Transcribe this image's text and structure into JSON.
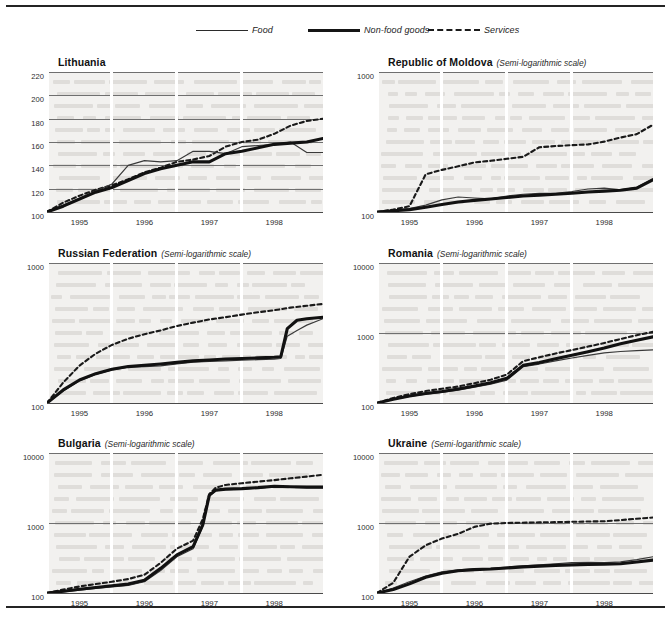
{
  "legend": {
    "items": [
      {
        "key": "food",
        "label": "Food",
        "style": "thin-solid"
      },
      {
        "key": "nonfood",
        "label": "Non-food goods",
        "style": "thick-solid"
      },
      {
        "key": "services",
        "label": "Services",
        "style": "dashed"
      }
    ]
  },
  "scale_note": "(Semi-logarithmic scale)",
  "xticks": [
    "1995",
    "1996",
    "1997",
    "1998"
  ],
  "chart_data": [
    {
      "type": "line",
      "title": "Lithuania",
      "scale": "linear",
      "subtitle": "",
      "xlabel": "",
      "ylabel": "",
      "xlim": [
        1994.5,
        1998.75
      ],
      "ylim": [
        100,
        220
      ],
      "yticks": [
        100,
        120,
        140,
        160,
        180,
        200,
        220
      ],
      "xticks": [
        1995,
        1996,
        1997,
        1998
      ],
      "grid": true,
      "legend_position": "top-center",
      "series": [
        {
          "name": "Food",
          "x": [
            1994.5,
            1994.75,
            1995.0,
            1995.25,
            1995.5,
            1995.75,
            1996.0,
            1996.25,
            1996.5,
            1996.75,
            1997.0,
            1997.25,
            1997.5,
            1997.75,
            1998.0,
            1998.25,
            1998.5,
            1998.75
          ],
          "values": [
            100,
            106,
            112,
            118,
            124,
            140,
            144,
            143,
            144,
            152,
            152,
            150,
            156,
            157,
            158,
            160,
            151,
            151
          ]
        },
        {
          "name": "Non-food goods",
          "x": [
            1994.5,
            1994.75,
            1995.0,
            1995.25,
            1995.5,
            1995.75,
            1996.0,
            1996.25,
            1996.5,
            1996.75,
            1997.0,
            1997.25,
            1997.5,
            1997.75,
            1998.0,
            1998.25,
            1998.5,
            1998.75
          ],
          "values": [
            100,
            105,
            111,
            117,
            121,
            127,
            133,
            137,
            140,
            143,
            143,
            150,
            152,
            155,
            158,
            159,
            160,
            163
          ]
        },
        {
          "name": "Services",
          "x": [
            1994.5,
            1994.75,
            1995.0,
            1995.25,
            1995.5,
            1995.75,
            1996.0,
            1996.25,
            1996.5,
            1996.75,
            1997.0,
            1997.25,
            1997.5,
            1997.75,
            1998.0,
            1998.25,
            1998.5,
            1998.75
          ],
          "values": [
            100,
            108,
            114,
            119,
            123,
            128,
            134,
            138,
            143,
            145,
            148,
            156,
            160,
            162,
            167,
            174,
            178,
            180
          ]
        }
      ]
    },
    {
      "type": "line",
      "title": "Republic of Moldova",
      "scale": "semi-log",
      "subtitle": "(Semi-logarithmic scale)",
      "xlabel": "",
      "ylabel": "",
      "xlim": [
        1994.5,
        1998.75
      ],
      "ylim": [
        100,
        1000
      ],
      "yticks": [
        100,
        1000
      ],
      "xticks": [
        1995,
        1996,
        1997,
        1998
      ],
      "grid": true,
      "legend_position": "top-center",
      "series": [
        {
          "name": "Food",
          "x": [
            1994.5,
            1994.75,
            1995.0,
            1995.25,
            1995.5,
            1995.75,
            1996.0,
            1996.25,
            1996.5,
            1996.75,
            1997.0,
            1997.25,
            1997.5,
            1997.75,
            1998.0,
            1998.25,
            1998.5,
            1998.75
          ],
          "values": [
            100,
            103,
            106,
            112,
            122,
            128,
            126,
            124,
            130,
            134,
            136,
            136,
            140,
            146,
            148,
            144,
            150,
            172
          ]
        },
        {
          "name": "Non-food goods",
          "x": [
            1994.5,
            1994.75,
            1995.0,
            1995.25,
            1995.5,
            1995.75,
            1996.0,
            1996.25,
            1996.5,
            1996.75,
            1997.0,
            1997.25,
            1997.5,
            1997.75,
            1998.0,
            1998.25,
            1998.5,
            1998.75
          ],
          "values": [
            100,
            102,
            104,
            108,
            113,
            118,
            121,
            124,
            127,
            130,
            132,
            134,
            136,
            139,
            141,
            143,
            148,
            170
          ]
        },
        {
          "name": "Services",
          "x": [
            1994.5,
            1994.75,
            1995.0,
            1995.25,
            1995.5,
            1995.75,
            1996.0,
            1996.25,
            1996.5,
            1996.75,
            1997.0,
            1997.25,
            1997.5,
            1997.75,
            1998.0,
            1998.25,
            1998.5,
            1998.75
          ],
          "values": [
            100,
            104,
            110,
            186,
            200,
            212,
            226,
            232,
            240,
            248,
            290,
            296,
            300,
            304,
            318,
            340,
            360,
            420
          ]
        }
      ]
    },
    {
      "type": "line",
      "title": "Russian Federation",
      "scale": "semi-log",
      "subtitle": "(Semi-logarithmic scale)",
      "xlabel": "",
      "ylabel": "",
      "xlim": [
        1994.5,
        1998.75
      ],
      "ylim": [
        100,
        1000
      ],
      "yticks": [
        100,
        1000
      ],
      "xticks": [
        1995,
        1996,
        1997,
        1998
      ],
      "grid": true,
      "legend_position": "top-center",
      "series": [
        {
          "name": "Food",
          "x": [
            1994.5,
            1994.75,
            1995.0,
            1995.25,
            1995.5,
            1995.75,
            1996.0,
            1996.25,
            1996.5,
            1996.75,
            1997.0,
            1997.25,
            1997.5,
            1997.75,
            1998.0,
            1998.1,
            1998.2,
            1998.35,
            1998.5,
            1998.75
          ],
          "values": [
            100,
            122,
            144,
            160,
            172,
            180,
            182,
            184,
            190,
            196,
            198,
            200,
            202,
            204,
            206,
            208,
            300,
            330,
            360,
            400
          ]
        },
        {
          "name": "Non-food goods",
          "x": [
            1994.5,
            1994.75,
            1995.0,
            1995.25,
            1995.5,
            1995.75,
            1996.0,
            1996.25,
            1996.5,
            1996.75,
            1997.0,
            1997.25,
            1997.5,
            1997.75,
            1998.0,
            1998.1,
            1998.2,
            1998.35,
            1998.5,
            1998.75
          ],
          "values": [
            100,
            124,
            146,
            162,
            174,
            182,
            186,
            190,
            195,
            200,
            203,
            206,
            208,
            210,
            212,
            214,
            340,
            390,
            400,
            410
          ]
        },
        {
          "name": "Services",
          "x": [
            1994.5,
            1994.75,
            1995.0,
            1995.25,
            1995.5,
            1995.75,
            1996.0,
            1996.25,
            1996.5,
            1996.75,
            1997.0,
            1997.25,
            1997.5,
            1997.75,
            1998.0,
            1998.25,
            1998.5,
            1998.75
          ],
          "values": [
            100,
            140,
            185,
            225,
            260,
            288,
            310,
            330,
            355,
            375,
            395,
            410,
            428,
            445,
            460,
            480,
            495,
            510
          ]
        }
      ]
    },
    {
      "type": "line",
      "title": "Romania",
      "scale": "semi-log",
      "subtitle": "(Semi-logarithmic scale)",
      "xlabel": "",
      "ylabel": "",
      "xlim": [
        1994.5,
        1998.75
      ],
      "ylim": [
        100,
        10000
      ],
      "yticks": [
        100,
        1000,
        10000
      ],
      "xticks": [
        1995,
        1996,
        1997,
        1998
      ],
      "grid": true,
      "legend_position": "top-center",
      "series": [
        {
          "name": "Food",
          "x": [
            1994.5,
            1994.75,
            1995.0,
            1995.25,
            1995.5,
            1995.75,
            1996.0,
            1996.25,
            1996.5,
            1996.75,
            1997.0,
            1997.25,
            1997.5,
            1997.75,
            1998.0,
            1998.25,
            1998.5,
            1998.75
          ],
          "values": [
            100,
            112,
            124,
            134,
            142,
            152,
            168,
            186,
            212,
            330,
            360,
            400,
            440,
            480,
            520,
            545,
            560,
            575
          ]
        },
        {
          "name": "Non-food goods",
          "x": [
            1994.5,
            1994.75,
            1995.0,
            1995.25,
            1995.5,
            1995.75,
            1996.0,
            1996.25,
            1996.5,
            1996.75,
            1997.0,
            1997.25,
            1997.5,
            1997.75,
            1998.0,
            1998.25,
            1998.5,
            1998.75
          ],
          "values": [
            100,
            113,
            126,
            137,
            146,
            158,
            175,
            195,
            225,
            345,
            380,
            430,
            480,
            540,
            610,
            700,
            790,
            880
          ]
        },
        {
          "name": "Services",
          "x": [
            1994.5,
            1994.75,
            1995.0,
            1995.25,
            1995.5,
            1995.75,
            1996.0,
            1996.25,
            1996.5,
            1996.75,
            1997.0,
            1997.25,
            1997.5,
            1997.75,
            1998.0,
            1998.25,
            1998.5,
            1998.75
          ],
          "values": [
            100,
            118,
            134,
            148,
            160,
            172,
            192,
            215,
            255,
            395,
            450,
            510,
            570,
            640,
            720,
            820,
            930,
            1040
          ]
        }
      ]
    },
    {
      "type": "line",
      "title": "Bulgaria",
      "scale": "semi-log",
      "subtitle": "(Semi-logarithmic scale)",
      "xlabel": "",
      "ylabel": "",
      "xlim": [
        1994.5,
        1998.75
      ],
      "ylim": [
        100,
        10000
      ],
      "yticks": [
        100,
        1000,
        10000
      ],
      "xticks": [
        1995,
        1996,
        1997,
        1998
      ],
      "grid": true,
      "legend_position": "top-center",
      "series": [
        {
          "name": "Food",
          "x": [
            1994.5,
            1994.75,
            1995.0,
            1995.25,
            1995.5,
            1995.75,
            1996.0,
            1996.25,
            1996.5,
            1996.75,
            1996.9,
            1997.0,
            1997.1,
            1997.25,
            1997.5,
            1997.75,
            1998.0,
            1998.25,
            1998.5,
            1998.75
          ],
          "values": [
            100,
            104,
            110,
            116,
            122,
            128,
            145,
            210,
            330,
            430,
            900,
            2400,
            2900,
            3000,
            3050,
            3150,
            3300,
            3250,
            3200,
            3200
          ]
        },
        {
          "name": "Non-food goods",
          "x": [
            1994.5,
            1994.75,
            1995.0,
            1995.25,
            1995.5,
            1995.75,
            1996.0,
            1996.25,
            1996.5,
            1996.75,
            1996.9,
            1997.0,
            1997.1,
            1997.25,
            1997.5,
            1997.75,
            1998.0,
            1998.25,
            1998.5,
            1998.75
          ],
          "values": [
            100,
            106,
            113,
            120,
            127,
            134,
            152,
            225,
            350,
            460,
            950,
            2500,
            2950,
            3050,
            3100,
            3200,
            3350,
            3300,
            3250,
            3250
          ]
        },
        {
          "name": "Services",
          "x": [
            1994.5,
            1994.75,
            1995.0,
            1995.25,
            1995.5,
            1995.75,
            1996.0,
            1996.25,
            1996.5,
            1996.75,
            1996.9,
            1997.0,
            1997.1,
            1997.25,
            1997.5,
            1997.75,
            1998.0,
            1998.25,
            1998.5,
            1998.75
          ],
          "values": [
            100,
            112,
            124,
            134,
            145,
            158,
            182,
            270,
            430,
            560,
            1150,
            2600,
            3200,
            3500,
            3700,
            3900,
            4100,
            4350,
            4600,
            4900
          ]
        }
      ]
    },
    {
      "type": "line",
      "title": "Ukraine",
      "scale": "semi-log",
      "subtitle": "(Semi-logarithmic scale)",
      "xlabel": "",
      "ylabel": "",
      "xlim": [
        1994.5,
        1998.75
      ],
      "ylim": [
        100,
        10000
      ],
      "yticks": [
        100,
        1000,
        10000
      ],
      "xticks": [
        1995,
        1996,
        1997,
        1998
      ],
      "grid": true,
      "legend_position": "top-center",
      "series": [
        {
          "name": "Food",
          "x": [
            1994.5,
            1994.75,
            1995.0,
            1995.25,
            1995.5,
            1995.75,
            1996.0,
            1996.25,
            1996.5,
            1996.75,
            1997.0,
            1997.25,
            1997.5,
            1997.75,
            1998.0,
            1998.25,
            1998.5,
            1998.75
          ],
          "values": [
            100,
            118,
            145,
            175,
            200,
            215,
            222,
            225,
            235,
            245,
            252,
            262,
            272,
            275,
            272,
            278,
            300,
            330
          ]
        },
        {
          "name": "Non-food goods",
          "x": [
            1994.5,
            1994.75,
            1995.0,
            1995.25,
            1995.5,
            1995.75,
            1996.0,
            1996.25,
            1996.5,
            1996.75,
            1997.0,
            1997.25,
            1997.5,
            1997.75,
            1998.0,
            1998.25,
            1998.5,
            1998.75
          ],
          "values": [
            100,
            112,
            135,
            168,
            192,
            208,
            216,
            220,
            228,
            236,
            242,
            248,
            252,
            256,
            258,
            262,
            278,
            295
          ]
        },
        {
          "name": "Services",
          "x": [
            1994.5,
            1994.75,
            1995.0,
            1995.25,
            1995.5,
            1995.75,
            1996.0,
            1996.25,
            1996.5,
            1996.75,
            1997.0,
            1997.25,
            1997.5,
            1997.75,
            1998.0,
            1998.25,
            1998.5,
            1998.75
          ],
          "values": [
            100,
            140,
            330,
            480,
            600,
            700,
            880,
            980,
            1000,
            1010,
            1020,
            1030,
            1040,
            1050,
            1060,
            1100,
            1150,
            1200
          ]
        }
      ]
    }
  ]
}
